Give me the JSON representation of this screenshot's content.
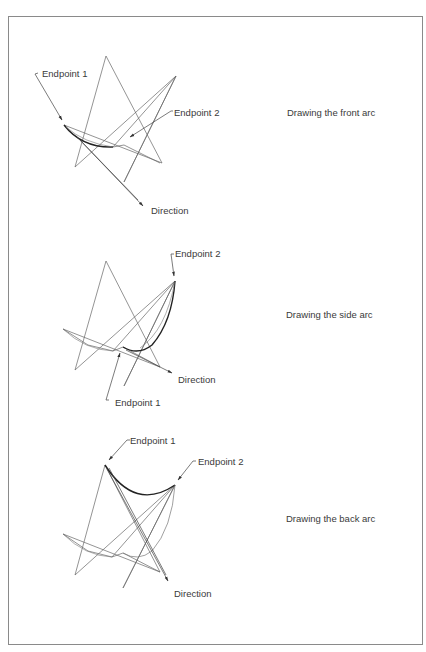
{
  "figure": {
    "panels": [
      {
        "caption": "Drawing the front arc",
        "labels": {
          "endpoint1": "Endpoint 1",
          "endpoint2": "Endpoint 2",
          "direction": "Direction"
        }
      },
      {
        "caption": "Drawing the side arc",
        "labels": {
          "endpoint1": "Endpoint 1",
          "endpoint2": "Endpoint 2",
          "direction": "Direction"
        }
      },
      {
        "caption": "Drawing the back arc",
        "labels": {
          "endpoint1": "Endpoint 1",
          "endpoint2": "Endpoint 2",
          "direction": "Direction"
        }
      }
    ],
    "colors": {
      "line": "#555555",
      "arc": "#222222",
      "text": "#3a3a3a",
      "frame": "#8a8a8a"
    }
  }
}
